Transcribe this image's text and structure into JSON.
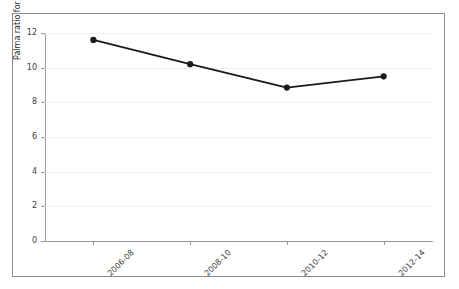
{
  "chart_data": {
    "type": "line",
    "title": "",
    "subtitle": "",
    "xlabel": "",
    "ylabel": "Palma ratio for household wealth",
    "categories": [
      "2006-08",
      "2008-10",
      "2010-12",
      "2012-14"
    ],
    "values": [
      11.6,
      10.2,
      8.85,
      9.5
    ],
    "series": [
      {
        "name": "Palma ratio for household wealth",
        "values": [
          11.6,
          10.2,
          8.85,
          9.5
        ]
      }
    ],
    "ylim": [
      0,
      12
    ],
    "yticks": [
      0,
      2,
      4,
      6,
      8,
      10,
      12
    ],
    "ytick_labels": [
      "0",
      "2",
      "4",
      "6",
      "8",
      "10",
      "12"
    ],
    "xtick_labels": [
      "2006-08",
      "2008-10",
      "2010-12",
      "2012-14"
    ],
    "grid": "horizontal",
    "legend": "none",
    "marker": "circle",
    "line_color": "#1a1a1a",
    "marker_color": "#1a1a1a",
    "grid_color": "#ededf2",
    "axis_color": "#9a9a9a",
    "frame_color": "#8c8c8c",
    "background_color": "#ffffff",
    "annotations": []
  }
}
